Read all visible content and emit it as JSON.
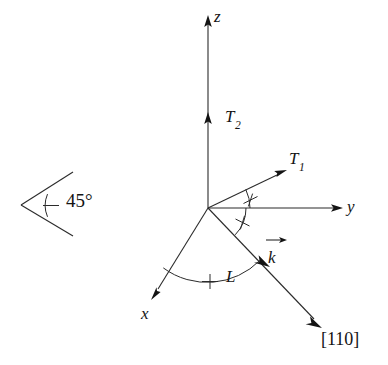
{
  "figure": {
    "background_color": "#ffffff",
    "stroke_color": "#2b2b2b",
    "text_color": "#141414",
    "width": 388,
    "height": 365
  },
  "angle_legend": {
    "label": "45°",
    "tick_marks": 1,
    "description": "single-tick angle key"
  },
  "axes": [
    {
      "name": "z-axis",
      "label": "z",
      "direction": "up",
      "origin": [
        208,
        208
      ],
      "tip": [
        208,
        18
      ]
    },
    {
      "name": "y-axis",
      "label": "y",
      "direction": "right",
      "origin": [
        208,
        208
      ],
      "tip": [
        340,
        208
      ]
    },
    {
      "name": "x-axis",
      "label": "x",
      "direction": "down-left",
      "origin": [
        208,
        208
      ],
      "tip": [
        153,
        297
      ]
    }
  ],
  "vectors": [
    {
      "name": "T2-vector",
      "label": "T",
      "subscript": "2",
      "origin": [
        208,
        208
      ],
      "tip": [
        208,
        118
      ]
    },
    {
      "name": "T1-vector",
      "label": "T",
      "subscript": "1",
      "origin": [
        208,
        208
      ],
      "tip": [
        284,
        171
      ]
    },
    {
      "name": "k-vector",
      "label": "k",
      "subscript": "",
      "origin": [
        208,
        208
      ],
      "tip": [
        266,
        263
      ]
    },
    {
      "name": "L-vector",
      "label": "L",
      "subscript": "",
      "origin": [
        208,
        208
      ],
      "tip": [
        320,
        325
      ]
    }
  ],
  "direction_label": {
    "name": "miller-index-110",
    "text": "[110]"
  },
  "angle_arcs": [
    {
      "name": "arc-y-to-T1",
      "tick_marks": 1,
      "radius": 42,
      "between": [
        "y-axis",
        "T1-vector"
      ]
    },
    {
      "name": "arc-y-to-110",
      "tick_marks": 1,
      "radius": 38,
      "between": [
        "y-axis",
        "[110]"
      ]
    },
    {
      "name": "arc-x-to-110",
      "tick_marks": 1,
      "radius": 74,
      "between": [
        "x-axis",
        "[110]"
      ]
    }
  ],
  "labels": {
    "z": "z",
    "y": "y",
    "x": "x",
    "T_base": "T",
    "T2_sub": "2",
    "T1_sub": "1",
    "k": "k",
    "L": "L",
    "miller": "[110]",
    "angle45": "45°"
  }
}
